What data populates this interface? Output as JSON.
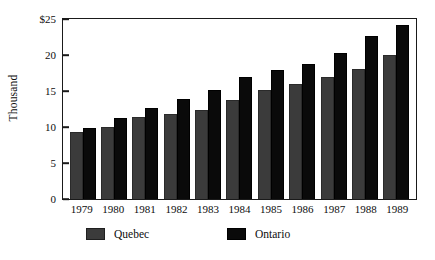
{
  "chart_data": {
    "type": "bar",
    "title": "",
    "xlabel": "",
    "ylabel": "Thousand",
    "categories": [
      "1979",
      "1980",
      "1981",
      "1982",
      "1983",
      "1984",
      "1985",
      "1986",
      "1987",
      "1988",
      "1989"
    ],
    "series": [
      {
        "name": "Quebec",
        "color": "#3b3b3b",
        "values": [
          9.3,
          10.0,
          11.4,
          11.8,
          12.4,
          13.8,
          15.2,
          16.0,
          16.9,
          18.0,
          20.0
        ]
      },
      {
        "name": "Ontario",
        "color": "#0a0a0a",
        "values": [
          9.8,
          11.3,
          12.6,
          13.9,
          15.1,
          17.0,
          17.9,
          18.8,
          20.3,
          22.7,
          24.2
        ]
      }
    ],
    "ylim": [
      0,
      25
    ],
    "ytick_values": [
      0,
      5,
      10,
      15,
      20,
      25
    ],
    "ytick_labels": [
      "0",
      "5",
      "10",
      "15",
      "20",
      "$25"
    ],
    "grid": false,
    "legend_position": "bottom"
  }
}
